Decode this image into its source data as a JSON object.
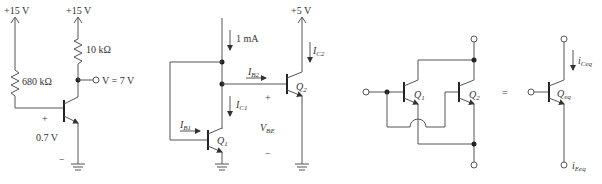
{
  "circuit_a": {
    "supply_left": "+15 V",
    "supply_right": "+15 V",
    "rb": "680 kΩ",
    "rc": "10 kΩ",
    "output": "V = 7 V",
    "vbe_plus": "+",
    "vbe_value": "0.7 V",
    "vbe_minus": "−"
  },
  "circuit_b": {
    "supply": "+5 V",
    "ref_current": "1 mA",
    "ic1": "I",
    "ic1_sub": "C1",
    "ib1": "I",
    "ib1_sub": "B1",
    "ib2": "I",
    "ib2_sub": "B2",
    "ic2": "I",
    "ic2_sub": "C2",
    "q1": "Q",
    "q1_sub": "1",
    "q2": "Q",
    "q2_sub": "2",
    "vbe": "V",
    "vbe_sub": "BE",
    "plus": "+",
    "minus": "−"
  },
  "circuit_c": {
    "q1": "Q",
    "q1_sub": "1",
    "q2": "Q",
    "q2_sub": "2",
    "equals": "=",
    "qeq": "Q",
    "qeq_sub": "eq",
    "ic": "i",
    "ic_sub": "Ceq",
    "ie": "i",
    "ie_sub": "Eeq"
  }
}
